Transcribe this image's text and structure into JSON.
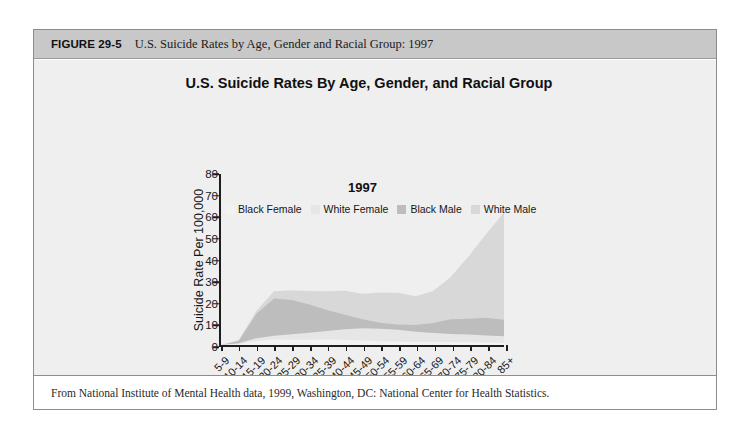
{
  "figure": {
    "number": "FIGURE 29-5",
    "caption": "U.S. Suicide Rates by Age, Gender and Racial Group: 1997",
    "footer": "From National Institute of Mental Health data, 1999, Washington, DC: National Center for Health Statistics."
  },
  "colors": {
    "header_band": "#c8c8c8",
    "plate": "#efefef",
    "axis": "#1d1d1d",
    "black_female": "#f2f2f2",
    "white_female": "#e6e6e6",
    "black_male": "#bdbdbd",
    "white_male": "#d8d8d8"
  },
  "chart_data": {
    "type": "area",
    "title": "U.S. Suicide Rates By Age, Gender, and Racial Group",
    "annotation": "1997",
    "xlabel": "Age Groups",
    "ylabel": "Suicide Rate Per 100,000",
    "categories": [
      "5-9",
      "10-14",
      "15-19",
      "20-24",
      "25-29",
      "30-34",
      "35-39",
      "40-44",
      "45-49",
      "50-54",
      "55-59",
      "60-64",
      "65-69",
      "70-74",
      "75-79",
      "80-84",
      "85+"
    ],
    "ylim": [
      0,
      80
    ],
    "yticks": [
      0,
      10,
      20,
      30,
      40,
      50,
      60,
      70,
      80
    ],
    "grid": false,
    "legend_position": "inside-top",
    "overlap_mode": "overlaid",
    "series": [
      {
        "name": "Black Female",
        "color": "#f2f2f2",
        "values": [
          0.0,
          0.3,
          1.9,
          2.6,
          2.4,
          2.5,
          2.6,
          2.5,
          2.1,
          1.8,
          1.6,
          1.4,
          1.5,
          1.4,
          1.3,
          1.2,
          1.1
        ]
      },
      {
        "name": "White Female",
        "color": "#e6e6e6",
        "values": [
          0.0,
          0.8,
          3.2,
          4.3,
          5.0,
          5.7,
          6.6,
          7.4,
          7.8,
          7.6,
          7.1,
          6.2,
          5.6,
          5.2,
          4.9,
          4.5,
          4.1
        ]
      },
      {
        "name": "Black Male",
        "color": "#bdbdbd",
        "values": [
          0.0,
          1.9,
          14.6,
          21.7,
          21.0,
          19.0,
          16.4,
          14.1,
          12.0,
          10.4,
          9.6,
          9.4,
          10.3,
          12.0,
          12.3,
          12.8,
          11.8
        ]
      },
      {
        "name": "White Male",
        "color": "#d8d8d8",
        "values": [
          0.0,
          2.3,
          16.0,
          25.2,
          25.6,
          25.3,
          25.2,
          25.4,
          24.0,
          24.6,
          24.4,
          22.8,
          25.3,
          31.9,
          41.5,
          52.1,
          62.0
        ]
      }
    ]
  }
}
